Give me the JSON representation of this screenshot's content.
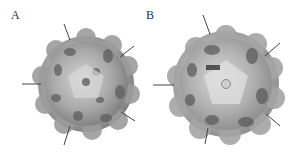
{
  "figure": {
    "panels": [
      {
        "label": "A",
        "label_pos": [
          11,
          9
        ],
        "capsid": {
          "cx": 86,
          "cy": 84,
          "r": 48,
          "base_color": "#a6a6a6",
          "dark_color": "#5a5a5a",
          "light_color": "#d8d8d8"
        },
        "pointers": [
          {
            "x1": 64,
            "y1": 24,
            "x2": 70,
            "y2": 40
          },
          {
            "x1": 134,
            "y1": 46,
            "x2": 120,
            "y2": 57
          },
          {
            "x1": 22,
            "y1": 84,
            "x2": 41,
            "y2": 84
          },
          {
            "x1": 135,
            "y1": 121,
            "x2": 121,
            "y2": 112
          },
          {
            "x1": 64,
            "y1": 145,
            "x2": 70,
            "y2": 126
          }
        ]
      },
      {
        "label": "B",
        "label_pos": [
          146,
          9
        ],
        "capsid": {
          "cx": 226,
          "cy": 84,
          "r": 53,
          "base_color": "#b0b0b0",
          "dark_color": "#555555",
          "light_color": "#dcdcdc"
        },
        "pointers": [
          {
            "x1": 203,
            "y1": 15,
            "x2": 210,
            "y2": 34
          },
          {
            "x1": 280,
            "y1": 43,
            "x2": 265,
            "y2": 56
          },
          {
            "x1": 153,
            "y1": 85,
            "x2": 174,
            "y2": 85
          },
          {
            "x1": 280,
            "y1": 126,
            "x2": 266,
            "y2": 114
          },
          {
            "x1": 205,
            "y1": 144,
            "x2": 208,
            "y2": 128
          }
        ]
      }
    ]
  }
}
